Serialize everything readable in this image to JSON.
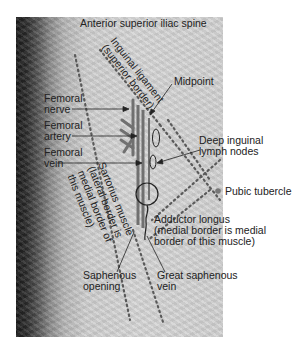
{
  "figure": {
    "labels": {
      "asis": "Anterior superior iliac spine",
      "inguinal_1": "Inguinal ligament",
      "inguinal_2": "(superior border)",
      "midpoint": "Midpoint",
      "fem_nerve_1": "Femoral",
      "fem_nerve_2": "nerve",
      "fem_artery_1": "Femoral",
      "fem_artery_2": "artery",
      "fem_vein_1": "Femoral",
      "fem_vein_2": "vein",
      "deep_nodes_1": "Deep inguinal",
      "deep_nodes_2": "lymph nodes",
      "pubic": "Pubic tubercle",
      "sartorius_1": "Sartorius muscle",
      "sartorius_2": "(lateral border is",
      "sartorius_3": "medial border of",
      "sartorius_4": "this muscle)",
      "adductor_1": "Adductor longus",
      "adductor_2": "(medial border is medial",
      "adductor_3": "border of this muscle)",
      "saph_open_1": "Saphenous",
      "saph_open_2": "opening",
      "gsv_1": "Great saphenous",
      "gsv_2": "vein"
    },
    "colors": {
      "structure": "#6e6e6e",
      "dots": "#5a5a5a",
      "leader": "#222222"
    }
  }
}
